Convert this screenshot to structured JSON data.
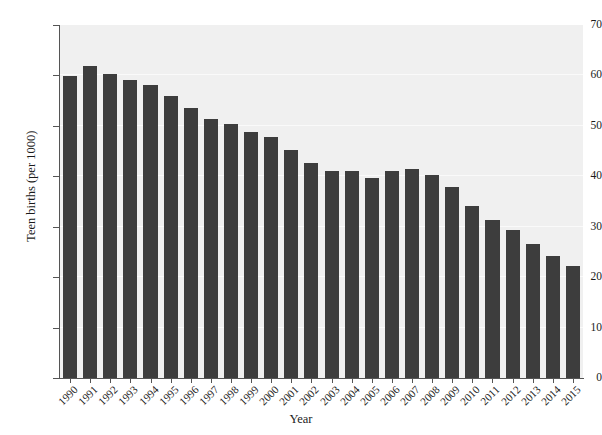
{
  "chart_data": {
    "type": "bar",
    "title": "",
    "xlabel": "Year",
    "ylabel": "Teen births (per 1000)",
    "categories": [
      "1990",
      "1991",
      "1992",
      "1993",
      "1994",
      "1995",
      "1996",
      "1997",
      "1998",
      "1999",
      "2000",
      "2001",
      "2002",
      "2003",
      "2004",
      "2005",
      "2006",
      "2007",
      "2008",
      "2009",
      "2010",
      "2011",
      "2012",
      "2013",
      "2014",
      "2015"
    ],
    "values": [
      59.9,
      61.8,
      60.3,
      59.0,
      58.2,
      56.0,
      53.5,
      51.3,
      50.3,
      48.8,
      47.7,
      45.3,
      42.6,
      41.1,
      41.1,
      39.7,
      41.1,
      41.5,
      40.2,
      37.9,
      34.2,
      31.3,
      29.4,
      26.5,
      24.2,
      22.3
    ],
    "ylim": [
      0,
      70
    ],
    "yticks": [
      0,
      10,
      20,
      30,
      40,
      50,
      60,
      70
    ],
    "grid": true,
    "legend": false,
    "bar_color": "#3d3d3d",
    "panel_color": "#f0f0f0"
  },
  "axes": {
    "y_title": "Teen births (per 1000)",
    "x_title": "Year"
  }
}
